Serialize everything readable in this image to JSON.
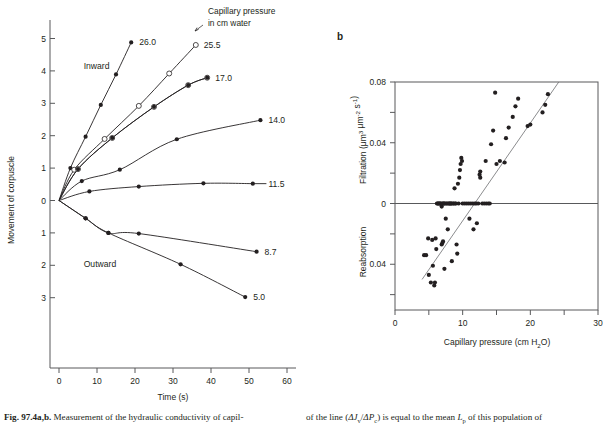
{
  "figure": {
    "panel_a_letter": "",
    "panel_b_letter": "b",
    "caption_left": "Measurement of the hydraulic conductivity of capil-",
    "caption_label": "Fig. 97.4a,b.",
    "caption_right_1": "of the line (",
    "caption_right_italic_1": "ΔJ",
    "caption_right_sub_1": "v",
    "caption_right_2": "/",
    "caption_right_italic_2": "ΔP",
    "caption_right_sub_2": "c",
    "caption_right_3": ") is equal to the mean ",
    "caption_right_italic_3": "L",
    "caption_right_sub_3": "p",
    "caption_right_4": " of this population of"
  },
  "chart_data": [
    {
      "type": "line",
      "panel": "a",
      "title": "",
      "xlabel": "Time (s)",
      "ylabel": "Movement of corpuscle",
      "xlim": [
        -5,
        64
      ],
      "ylim": [
        -3.6,
        5.6
      ],
      "xticks": [
        0,
        10,
        20,
        30,
        40,
        50,
        60
      ],
      "xticklabels": [
        "0",
        "10",
        "20",
        "30",
        "40",
        "50",
        "60"
      ],
      "yticks": [
        5,
        4,
        3,
        2,
        1,
        0,
        -1,
        -2,
        -3
      ],
      "yticklabels": [
        "5",
        "4",
        "3",
        "2",
        "1",
        "0",
        "1",
        "2",
        "3"
      ],
      "grid": false,
      "legend": "none",
      "annotations": [
        {
          "text": "Capillary pressure",
          "x": 30,
          "y": 5.35
        },
        {
          "text": "in cm water",
          "x": 30,
          "y": 4.95
        },
        {
          "text": "Inward",
          "x": 6.5,
          "y": 4.05
        },
        {
          "text": "Outward",
          "x": 6.5,
          "y": -2.05
        }
      ],
      "series": [
        {
          "name": "26.0",
          "label": "26.0",
          "marker": "filled",
          "points": [
            [
              0,
              0
            ],
            [
              3,
              1.0
            ],
            [
              7,
              1.97
            ],
            [
              11,
              2.95
            ],
            [
              15,
              3.89
            ],
            [
              19,
              4.88
            ]
          ]
        },
        {
          "name": "25.5",
          "label": "25.5",
          "marker": "open",
          "points": [
            [
              0,
              0
            ],
            [
              4,
              0.95
            ],
            [
              12,
              1.9
            ],
            [
              21,
              2.92
            ],
            [
              29,
              3.92
            ],
            [
              36,
              4.8
            ]
          ]
        },
        {
          "name": "17.0",
          "label": "17.0",
          "marker": "open",
          "points": [
            [
              0,
              0
            ],
            [
              5,
              0.97
            ],
            [
              14,
              1.93
            ],
            [
              25,
              2.89
            ],
            [
              34,
              3.56
            ],
            [
              39,
              3.79
            ]
          ]
        },
        {
          "name": "17.0b",
          "label": "",
          "marker": "filled",
          "points": [
            [
              0,
              0
            ],
            [
              5,
              0.97
            ],
            [
              14,
              1.93
            ],
            [
              25,
              2.89
            ],
            [
              34,
              3.56
            ],
            [
              39,
              3.79
            ]
          ]
        },
        {
          "name": "14.0",
          "label": "14.0",
          "marker": "filled",
          "points": [
            [
              0,
              0
            ],
            [
              6,
              0.6
            ],
            [
              16,
              0.95
            ],
            [
              31,
              1.89
            ],
            [
              53,
              2.48
            ]
          ]
        },
        {
          "name": "11.5",
          "label": "11.5",
          "marker": "filled",
          "points": [
            [
              0,
              0
            ],
            [
              8,
              0.28
            ],
            [
              21,
              0.43
            ],
            [
              38,
              0.53
            ],
            [
              51,
              0.52
            ]
          ]
        },
        {
          "name": "8.7",
          "label": "8.7",
          "marker": "filled",
          "points": [
            [
              0,
              0
            ],
            [
              7,
              -0.55
            ],
            [
              13,
              -1.0
            ],
            [
              21,
              -1.02
            ],
            [
              52,
              -1.58
            ]
          ]
        },
        {
          "name": "5.0",
          "label": "5.0",
          "marker": "filled",
          "points": [
            [
              0,
              0
            ],
            [
              7,
              -0.55
            ],
            [
              13,
              -1.0
            ],
            [
              32,
              -1.97
            ],
            [
              49,
              -2.98
            ]
          ]
        }
      ]
    },
    {
      "type": "scatter",
      "panel": "b",
      "title": "",
      "xlabel": "Capillary pressure (cm H₂O)",
      "ylabel_top": "Filtration (μm³ μm⁻² s⁻¹)",
      "ylabel_bottom": "Reabsorption",
      "xlim": [
        0,
        30
      ],
      "ylim": [
        -0.062,
        0.082
      ],
      "xticks": [
        0,
        5,
        10,
        15,
        20,
        25,
        30
      ],
      "xticklabels": [
        "0",
        "",
        "10",
        "",
        "20",
        "",
        "30"
      ],
      "yticks": [
        0.08,
        0.06,
        0.04,
        0.02,
        0,
        -0.02,
        -0.04,
        -0.06
      ],
      "yticklabels": [
        "0.08",
        "",
        "0.04",
        "",
        "0",
        "",
        "0.04",
        ""
      ],
      "grid": false,
      "legend": "none",
      "zero_line": 0,
      "fit_line": {
        "x0": 4.0,
        "y0": -0.05,
        "x1": 24.2,
        "y1": 0.08
      },
      "points": [
        [
          4.3,
          -0.034
        ],
        [
          4.6,
          -0.034
        ],
        [
          4.9,
          -0.023
        ],
        [
          5.0,
          -0.047
        ],
        [
          5.3,
          -0.052
        ],
        [
          5.5,
          -0.024
        ],
        [
          5.6,
          -0.041
        ],
        [
          5.8,
          -0.054
        ],
        [
          5.9,
          -0.052
        ],
        [
          6.0,
          -0.023
        ],
        [
          6.1,
          -0.03
        ],
        [
          6.2,
          -0.0
        ],
        [
          6.3,
          -0.0
        ],
        [
          6.4,
          -0.0
        ],
        [
          6.5,
          -0.0
        ],
        [
          6.6,
          -0.0
        ],
        [
          6.7,
          -0.0
        ],
        [
          6.8,
          -0.0
        ],
        [
          6.9,
          -0.002
        ],
        [
          6.9,
          -0.027
        ],
        [
          7.0,
          -0.0
        ],
        [
          7.0,
          -0.026
        ],
        [
          7.1,
          -0.025
        ],
        [
          7.1,
          -0.0
        ],
        [
          7.2,
          -0.0
        ],
        [
          7.3,
          -0.0
        ],
        [
          7.3,
          -0.043
        ],
        [
          7.4,
          -0.0
        ],
        [
          7.5,
          -0.01
        ],
        [
          7.6,
          -0.0
        ],
        [
          7.7,
          -0.0
        ],
        [
          7.8,
          -0.017
        ],
        [
          7.9,
          -0.0
        ],
        [
          8.0,
          -0.0
        ],
        [
          8.1,
          -0.0
        ],
        [
          8.2,
          -0.0
        ],
        [
          8.3,
          -0.0
        ],
        [
          8.4,
          -0.0
        ],
        [
          8.4,
          -0.038
        ],
        [
          8.6,
          -0.0
        ],
        [
          8.7,
          -0.0
        ],
        [
          8.8,
          0.01
        ],
        [
          8.9,
          -0.0
        ],
        [
          9.0,
          -0.0
        ],
        [
          9.1,
          -0.027
        ],
        [
          9.2,
          -0.033
        ],
        [
          9.3,
          0.013
        ],
        [
          9.4,
          -0.0
        ],
        [
          9.5,
          0.017
        ],
        [
          9.6,
          0.022
        ],
        [
          9.7,
          0.026
        ],
        [
          9.8,
          0.03
        ],
        [
          9.9,
          0.028
        ],
        [
          10.0,
          -0.0
        ],
        [
          10.3,
          -0.0
        ],
        [
          10.6,
          -0.0
        ],
        [
          10.9,
          -0.0
        ],
        [
          11.0,
          -0.01
        ],
        [
          11.2,
          -0.0
        ],
        [
          11.5,
          -0.0
        ],
        [
          11.6,
          -0.017
        ],
        [
          11.8,
          -0.0
        ],
        [
          12.0,
          -0.0
        ],
        [
          12.1,
          -0.013
        ],
        [
          12.3,
          -0.0
        ],
        [
          12.5,
          0.019
        ],
        [
          12.6,
          0.021
        ],
        [
          12.6,
          0.017
        ],
        [
          12.9,
          -0.0
        ],
        [
          13.2,
          -0.0
        ],
        [
          13.4,
          0.028
        ],
        [
          13.5,
          -0.0
        ],
        [
          13.8,
          -0.0
        ],
        [
          14.0,
          -0.0
        ],
        [
          14.2,
          0.039
        ],
        [
          14.5,
          0.048
        ],
        [
          14.8,
          0.073
        ],
        [
          15.0,
          0.026
        ],
        [
          15.5,
          0.028
        ],
        [
          16.2,
          0.027
        ],
        [
          16.4,
          0.043
        ],
        [
          16.8,
          0.05
        ],
        [
          17.4,
          0.057
        ],
        [
          17.8,
          0.064
        ],
        [
          18.2,
          0.069
        ],
        [
          19.6,
          0.051
        ],
        [
          20.0,
          0.052
        ],
        [
          21.8,
          0.06
        ],
        [
          22.2,
          0.065
        ],
        [
          22.6,
          0.072
        ]
      ]
    }
  ]
}
